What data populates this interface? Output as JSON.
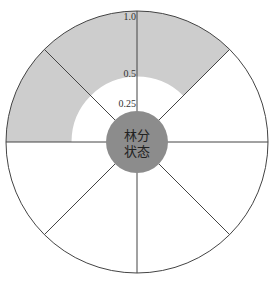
{
  "diagram": {
    "center": {
      "cx": 137,
      "cy": 142
    },
    "outer_radius": 131,
    "inner_circle_radius": 31,
    "sector_count": 8,
    "center_label_lines": [
      "林分",
      "状态"
    ],
    "radial_ticks": [
      {
        "label": "1.0",
        "value": 1.0
      },
      {
        "label": "0.5",
        "value": 0.5
      },
      {
        "label": "0.25",
        "value": 0.25
      }
    ],
    "shaded_sectors": [
      {
        "start_deg": 270,
        "end_deg": 315,
        "from": 0.5,
        "to": 1.0
      },
      {
        "start_deg": 225,
        "end_deg": 270,
        "from": 0.5,
        "to": 1.0
      },
      {
        "start_deg": 180,
        "end_deg": 225,
        "from": 0.5,
        "to": 1.0
      }
    ],
    "colors": {
      "shade": "#cdcdcd",
      "center_fill": "#8c8c8c",
      "line": "#444444",
      "background": "#ffffff"
    }
  }
}
